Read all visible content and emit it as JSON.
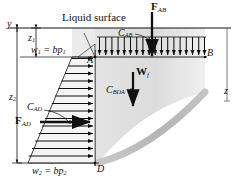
{
  "figure": {
    "title_text": "Liquid surface",
    "background_color": "#ffffff",
    "ink_color": "#101010",
    "fluid_fill_color": "#dcdcdc",
    "curve_color": "#b9b9b9",
    "width_px": 239,
    "height_px": 183
  },
  "labels": {
    "liquid_surface": "Liquid surface",
    "axis_y": "y",
    "axis_z": "z",
    "depth_z1": "z",
    "depth_z1_sub": "1",
    "depth_z2": "z",
    "depth_z2_sub": "2",
    "w1_expr": "w",
    "w1_sub": "1",
    "w1_rhs": " = bp",
    "w1_rhs_sub": "1",
    "w2_expr": "w",
    "w2_sub": "2",
    "w2_rhs": " = bp",
    "w2_rhs_sub": "2",
    "point_a": "A",
    "point_b": "B",
    "point_d": "D",
    "force_ab": "F",
    "force_ab_sub": "AB",
    "force_ad": "F",
    "force_ad_sub": "AD",
    "weight_f": "W",
    "weight_f_sub": "f",
    "centroid_ab": "C",
    "centroid_ab_sub": "AB",
    "centroid_ad": "C",
    "centroid_ad_sub": "AD",
    "centroid_bda": "C",
    "centroid_bda_sub": "BDA"
  },
  "geometry": {
    "surface_line_y": 28,
    "wall_x": 95,
    "point_a_y": 57,
    "point_b_x": 205,
    "point_d_y": 163,
    "top_arrow_count": 18,
    "side_arrow_count": 14,
    "pressure_left_top_x": 72,
    "pressure_left_bottom_x": 28
  }
}
